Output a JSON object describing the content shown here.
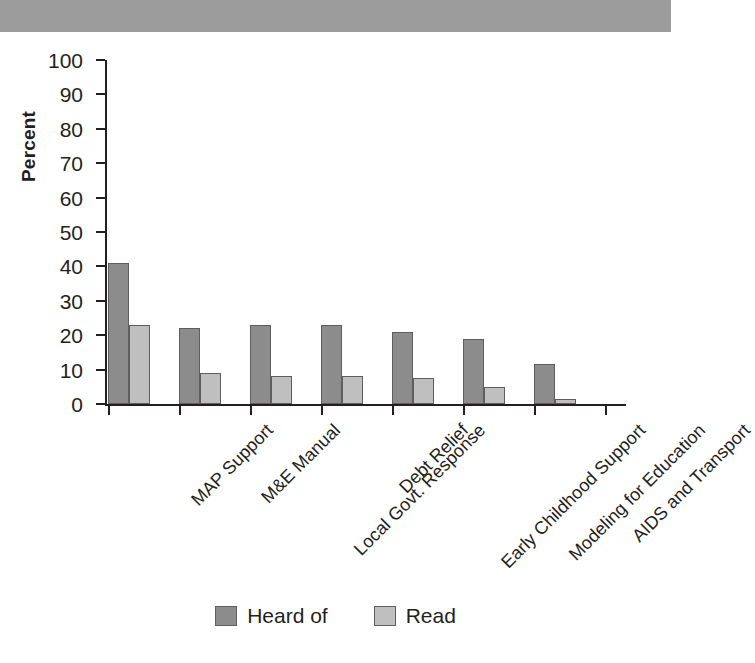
{
  "banner": {
    "label": "top-gray-band"
  },
  "chart_data": {
    "type": "bar",
    "title": "",
    "xlabel": "",
    "ylabel": "Percent",
    "ylim": [
      0,
      100
    ],
    "yticks": [
      0,
      10,
      20,
      30,
      40,
      50,
      60,
      70,
      80,
      90,
      100
    ],
    "grid": false,
    "legend_position": "bottom-center",
    "categories": [
      "MAP Support",
      "M&E Manual",
      "Local Govt. Response",
      "Debt Relief",
      "Early Childhood Support",
      "Modeling for Education",
      "AIDS and Transport"
    ],
    "series": [
      {
        "name": "Heard of",
        "color": "#8c8c8c",
        "values": [
          41,
          22,
          23,
          23,
          21,
          19,
          11.5
        ]
      },
      {
        "name": "Read",
        "color": "#bfbfbf",
        "values": [
          23,
          9,
          8,
          8,
          7.5,
          5,
          1.5
        ]
      }
    ]
  },
  "legend": {
    "entries": [
      {
        "label": "Heard of"
      },
      {
        "label": "Read"
      }
    ]
  }
}
